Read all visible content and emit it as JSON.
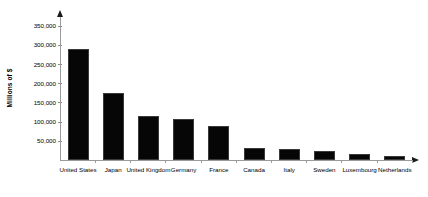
{
  "chart_data": {
    "type": "bar",
    "title": "",
    "xlabel": "",
    "ylabel": "Millions of $",
    "categories": [
      "United States",
      "Japan",
      "United Kingdom",
      "Germany",
      "France",
      "Canada",
      "Italy",
      "Sweden",
      "Luxembourg",
      "Netherlands"
    ],
    "values": [
      290000,
      175000,
      115000,
      107000,
      88000,
      31000,
      28000,
      24000,
      16000,
      10000
    ],
    "ylim": [
      0,
      350000
    ],
    "ytick_values": [
      50000,
      100000,
      150000,
      200000,
      250000,
      300000,
      350000
    ],
    "ytick_labels": [
      "50,000",
      "100,000",
      "150,000",
      "200,000",
      "250,000",
      "300,000",
      "350,000"
    ],
    "grid": false,
    "legend": null,
    "bar_color": "#060606",
    "axis_color": "#9a9a9a"
  }
}
